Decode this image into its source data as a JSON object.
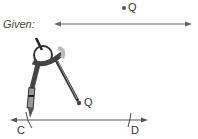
{
  "diagram": {
    "given_label": "Given:",
    "point_top": "Q",
    "point_mid": "Q",
    "point_c": "C",
    "point_d": "D",
    "line_color": "#555555",
    "compass_color": "#3a3a3a"
  }
}
